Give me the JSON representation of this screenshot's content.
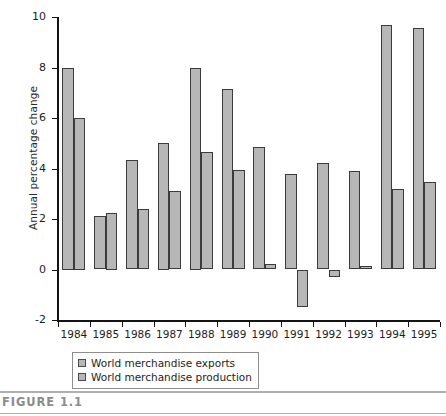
{
  "figure": {
    "caption": "FIGURE 1.1"
  },
  "chart_data": {
    "type": "bar",
    "title": "",
    "subtitle": "",
    "xlabel": "",
    "ylabel": "Annual percentage change",
    "ylim": [
      -2,
      10
    ],
    "ytick_values": [
      -2,
      0,
      2,
      4,
      6,
      8,
      10
    ],
    "ytick_labels": [
      "-2",
      "0",
      "2",
      "4",
      "6",
      "8",
      "10"
    ],
    "grid": false,
    "legend_position": "below-axis-left",
    "categories": [
      "1984",
      "1985",
      "1986",
      "1987",
      "1988",
      "1989",
      "1990",
      "1991",
      "1992",
      "1993",
      "1994",
      "1995"
    ],
    "series": [
      {
        "name": "World merchandise exports",
        "color": "#b7b7b7",
        "values": [
          8.0,
          2.1,
          4.35,
          5.0,
          8.0,
          7.15,
          4.85,
          3.8,
          4.2,
          3.9,
          9.7,
          9.55
        ]
      },
      {
        "name": "World merchandise production",
        "color": "#b7b7b7",
        "values": [
          6.0,
          2.25,
          2.4,
          3.1,
          4.65,
          3.95,
          0.2,
          -1.5,
          -0.3,
          0.15,
          3.2,
          3.45
        ]
      }
    ],
    "annotations": []
  },
  "legend": {
    "entries": [
      {
        "label": "World merchandise exports"
      },
      {
        "label": "World merchandise production"
      }
    ]
  }
}
